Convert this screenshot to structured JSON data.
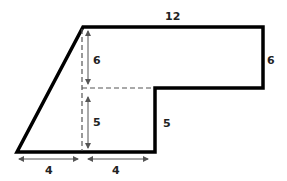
{
  "figure": {
    "type": "composite-shape-area",
    "colors": {
      "outline": "#000000",
      "dashed": "#555555",
      "arrow": "#555555",
      "text": "#222222"
    },
    "labels": {
      "top_length": "12",
      "right_height": "6",
      "inner_upper_height": "6",
      "inner_lower_height": "5",
      "step_height": "5",
      "bottom_left_width": "4",
      "bottom_right_width": "4"
    }
  }
}
